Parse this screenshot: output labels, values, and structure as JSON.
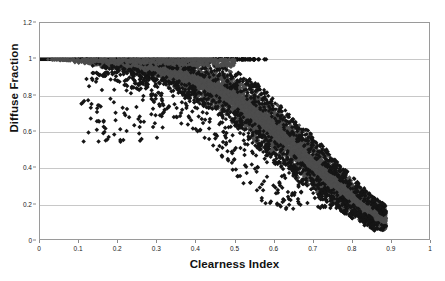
{
  "chart_data": {
    "type": "scatter",
    "title": "",
    "xlabel": "Clearness Index",
    "ylabel": "Diffuse Fraction",
    "xlim": [
      0,
      1
    ],
    "ylim": [
      0,
      1.2
    ],
    "xticks": [
      "0",
      "0.1",
      "0.2",
      "0.3",
      "0.4",
      "0.5",
      "0.6",
      "0.7",
      "0.8",
      "0.9",
      "1"
    ],
    "xtick_values": [
      0,
      0.1,
      0.2,
      0.3,
      0.4,
      0.5,
      0.6,
      0.7,
      0.8,
      0.9,
      1.0
    ],
    "yticks": [
      "0",
      "0.2",
      "0.4",
      "0.6",
      "0.8",
      "1",
      "1.2"
    ],
    "ytick_values": [
      0,
      0.2,
      0.4,
      0.6,
      0.8,
      1.0,
      1.2
    ],
    "grid": "horizontal",
    "legend": "none",
    "marker": {
      "shape": "diamond",
      "size_px": 2.1,
      "core_color": "#4d4d4d",
      "outlier_color": "#151515",
      "saturation_color": "#101010"
    },
    "series": [
      {
        "name": "Saturated overcast band",
        "description": "Points pinned at diffuse fraction = 1.0 for low clearness index",
        "x_range": [
          0.0,
          0.58
        ],
        "y_value": 1.0,
        "solid_until_x": 0.44,
        "n_points": 900
      },
      {
        "name": "Main correlation cloud",
        "description": "Dense descending band of hourly diffuse fraction versus clearness index",
        "n_points": 6500,
        "x_range": [
          0.08,
          0.885
        ],
        "y_range": [
          0.06,
          1.0
        ],
        "curve_points": [
          {
            "x": 0.1,
            "y": 0.995
          },
          {
            "x": 0.2,
            "y": 0.975
          },
          {
            "x": 0.3,
            "y": 0.945
          },
          {
            "x": 0.4,
            "y": 0.885
          },
          {
            "x": 0.45,
            "y": 0.84
          },
          {
            "x": 0.5,
            "y": 0.78
          },
          {
            "x": 0.55,
            "y": 0.7
          },
          {
            "x": 0.6,
            "y": 0.61
          },
          {
            "x": 0.65,
            "y": 0.515
          },
          {
            "x": 0.7,
            "y": 0.42
          },
          {
            "x": 0.75,
            "y": 0.325
          },
          {
            "x": 0.8,
            "y": 0.235
          },
          {
            "x": 0.85,
            "y": 0.155
          },
          {
            "x": 0.88,
            "y": 0.11
          }
        ],
        "spread": [
          {
            "x": 0.1,
            "half_width": 0.01
          },
          {
            "x": 0.25,
            "half_width": 0.03
          },
          {
            "x": 0.4,
            "half_width": 0.07
          },
          {
            "x": 0.55,
            "half_width": 0.105
          },
          {
            "x": 0.7,
            "half_width": 0.095
          },
          {
            "x": 0.85,
            "half_width": 0.055
          }
        ]
      },
      {
        "name": "Sparse low outliers",
        "description": "Scattered individual points below and left of the dense band",
        "n_points": 430,
        "x_range": [
          0.1,
          0.88
        ],
        "y_range": [
          0.15,
          0.92
        ]
      }
    ]
  }
}
